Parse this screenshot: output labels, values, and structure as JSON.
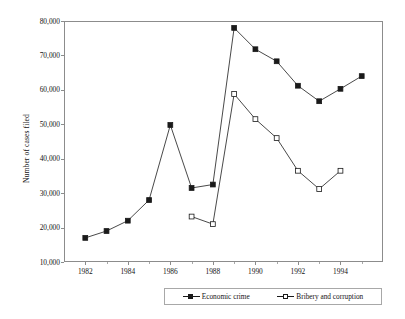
{
  "chart_data": {
    "type": "line",
    "title": "",
    "xlabel": "",
    "ylabel": "Number of cases filed",
    "xlim": [
      1981,
      1996
    ],
    "ylim": [
      10000,
      80000
    ],
    "grid": false,
    "legend_position": "bottom",
    "x_ticks": [
      1982,
      1984,
      1986,
      1988,
      1990,
      1992,
      1994
    ],
    "x_tick_labels": [
      "1982",
      "1984",
      "1986",
      "1988",
      "1990",
      "1992",
      "1994"
    ],
    "x_minor_ticks": [
      1983,
      1985,
      1987,
      1989,
      1991,
      1993,
      1995
    ],
    "y_ticks": [
      10000,
      20000,
      30000,
      40000,
      50000,
      60000,
      70000,
      80000
    ],
    "y_tick_labels": [
      "10,000",
      "20,000",
      "30,000",
      "40,000",
      "50,000",
      "60,000",
      "70,000",
      "80,000"
    ],
    "series": [
      {
        "name": "Economic crime",
        "marker": "filled-square",
        "color": "#1a1a1a",
        "x": [
          1982,
          1983,
          1984,
          1985,
          1986,
          1987,
          1988,
          1989,
          1990,
          1991,
          1992,
          1993,
          1994,
          1995
        ],
        "values": [
          17000,
          19000,
          22000,
          28000,
          49800,
          31500,
          32500,
          78000,
          71800,
          68300,
          61200,
          56700,
          60300,
          64000
        ]
      },
      {
        "name": "Bribery and corruption",
        "marker": "open-square",
        "color": "#1a1a1a",
        "x": [
          1987,
          1988,
          1989,
          1990,
          1991,
          1992,
          1993,
          1994
        ],
        "values": [
          23200,
          21000,
          58800,
          51500,
          46000,
          36500,
          31200,
          36500
        ]
      }
    ]
  },
  "legend": {
    "entries": [
      {
        "label": "Economic crime",
        "marker": "filled-square"
      },
      {
        "label": "Bribery and corruption",
        "marker": "open-square"
      }
    ]
  },
  "axis": {
    "y_title": "Number of cases filed"
  },
  "colors": {
    "line": "#1a1a1a",
    "frame": "#8c8c8c",
    "background": "#ffffff"
  }
}
